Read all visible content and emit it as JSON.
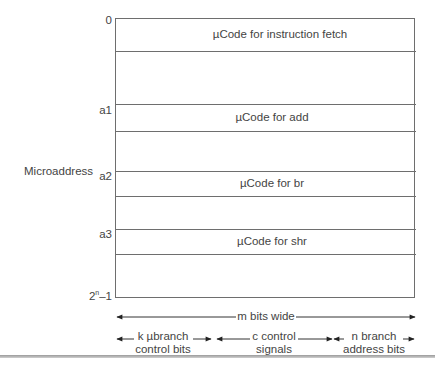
{
  "diagram": {
    "axis_label": "Microaddress",
    "addresses": [
      {
        "label": "0",
        "base": "0",
        "sup": ""
      },
      {
        "label": "a1",
        "base": "a1",
        "sup": ""
      },
      {
        "label": "a2",
        "base": "a2",
        "sup": ""
      },
      {
        "label": "a3",
        "base": "a3",
        "sup": ""
      },
      {
        "label": "2^n-1",
        "base": "2",
        "sup": "n",
        "suffix": "–1"
      }
    ],
    "blocks": [
      {
        "label": "µCode for instruction fetch"
      },
      {
        "label": "µCode for add"
      },
      {
        "label": "µCode for br"
      },
      {
        "label": "µCode for shr"
      }
    ],
    "width_label": "m bits wide",
    "fields": [
      {
        "line1": "k µbranch",
        "line2": "control bits"
      },
      {
        "line1": "c control",
        "line2": "signals"
      },
      {
        "line1": "n branch",
        "line2": "address bits"
      }
    ]
  }
}
